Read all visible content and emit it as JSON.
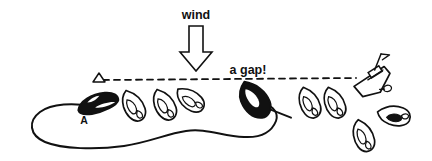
{
  "canvas": {
    "width": 432,
    "height": 161,
    "background": "#ffffff",
    "ink": "#111111"
  },
  "annotations": {
    "wind_label": "wind",
    "gap_label": "a gap!",
    "boat_a_label": "A"
  },
  "icons": {
    "wind_arrow": "arrow-down-icon",
    "pin_mark": "triangle-mark-icon",
    "committee_boat": "committee-boat-icon",
    "start_line": "dashed-line-icon",
    "fleet_outline": "closed-curve-icon"
  },
  "scene": {
    "start_line": {
      "name": "start-line",
      "x1": 98,
      "y1": 80,
      "x2": 356,
      "y2": 79,
      "style": "dashed",
      "dash": "6 5",
      "width": 1.8
    },
    "wind_arrow": {
      "name": "wind-arrow",
      "direction": "down",
      "tip_x": 196,
      "tip_y": 68,
      "top_y": 26,
      "shaft_half_width": 7,
      "head_half_width": 16,
      "head_top_y": 52,
      "fill": "#ffffff",
      "stroke": "#111111"
    },
    "pin_mark": {
      "name": "pin-mark",
      "x": 99,
      "y": 80,
      "size": 7,
      "fill": "#ffffff"
    },
    "boats": [
      {
        "id": "boat-a",
        "label": "A",
        "fill": "black",
        "cx": 97,
        "cy": 105,
        "rot": -18,
        "scale": 1.18,
        "type": "leading-boat"
      },
      {
        "id": "boat-2",
        "label": "",
        "fill": "white",
        "cx": 133,
        "cy": 106,
        "rot": -22,
        "scale": 1.0,
        "type": "fleet-boat"
      },
      {
        "id": "boat-3",
        "label": "",
        "fill": "white",
        "cx": 164,
        "cy": 105,
        "rot": -22,
        "scale": 1.0,
        "type": "fleet-boat"
      },
      {
        "id": "boat-4",
        "label": "",
        "fill": "white",
        "cx": 189,
        "cy": 101,
        "rot": -34,
        "scale": 0.96,
        "type": "fleet-boat"
      },
      {
        "id": "boat-gap",
        "label": "",
        "fill": "black",
        "cx": 254,
        "cy": 101,
        "rot": -22,
        "scale": 1.22,
        "type": "gap-boat"
      },
      {
        "id": "boat-6",
        "label": "",
        "fill": "white",
        "cx": 309,
        "cy": 103,
        "rot": -18,
        "scale": 0.98,
        "type": "fleet-boat"
      },
      {
        "id": "boat-7",
        "label": "",
        "fill": "white",
        "cx": 334,
        "cy": 103,
        "rot": -18,
        "scale": 0.98,
        "type": "fleet-boat"
      },
      {
        "id": "boat-8",
        "label": "",
        "fill": "white",
        "cx": 394,
        "cy": 115,
        "rot": -72,
        "scale": 1.0,
        "type": "over-line-boat"
      },
      {
        "id": "boat-9",
        "label": "",
        "fill": "white",
        "cx": 363,
        "cy": 135,
        "rot": -14,
        "scale": 1.0,
        "type": "over-line-boat"
      }
    ],
    "committee_boat": {
      "name": "committee-boat",
      "x": 356,
      "y": 72,
      "rot": -16
    },
    "fleet_outline": {
      "name": "fleet-outline-curve",
      "description": "closed wandering curve around the fleet"
    }
  }
}
